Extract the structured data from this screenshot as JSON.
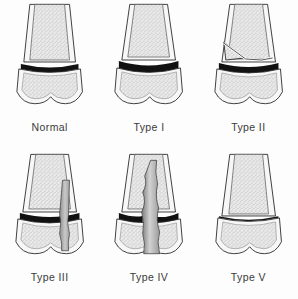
{
  "figure": {
    "background_color": "#fdfdfd",
    "label_color": "#3a3a3a",
    "columns": 3,
    "rows": 2
  },
  "palette": {
    "outline": "#2b2b2b",
    "cortex_fill": "#f7f7f7",
    "trabecular_light": "#e9e9e9",
    "trabecular_speckle": "#9a9a9a",
    "physis_black": "#111111",
    "fracture_gray_light": "#d8d8d8",
    "fracture_gray_dark": "#8e8e8e",
    "gap_white": "#ffffff"
  },
  "panels": [
    {
      "id": "normal",
      "label": "Normal",
      "physis": "intact-thick-black-band",
      "fracture": "none",
      "description": "Intact growth plate with no fracture line"
    },
    {
      "id": "type-1",
      "label": "Type I",
      "physis": "widened-thick-black-band",
      "fracture": "through-physis-only",
      "description": "Fracture separation straight through the physis"
    },
    {
      "id": "type-2",
      "label": "Type II",
      "physis": "thick-black-band",
      "fracture": "physis-plus-metaphyseal-corner-fragment",
      "fragment_side": "left",
      "description": "Fracture through physis exiting into metaphysis leaving a triangular fragment"
    },
    {
      "id": "type-3",
      "label": "Type III",
      "physis": "thick-black-band",
      "fracture": "physis-plus-epiphysis-vertical",
      "fragment_side": "right",
      "description": "Fracture through physis extending down through the epiphysis"
    },
    {
      "id": "type-4",
      "label": "Type IV",
      "physis": "thick-black-band-split",
      "fracture": "metaphysis-physis-epiphysis-vertical",
      "fragment_side": "center",
      "description": "Fracture crossing metaphysis, physis and epiphysis"
    },
    {
      "id": "type-5",
      "label": "Type V",
      "physis": "compressed-thin-line",
      "fracture": "crush-injury",
      "description": "Compression crush injury of the growth plate"
    }
  ]
}
